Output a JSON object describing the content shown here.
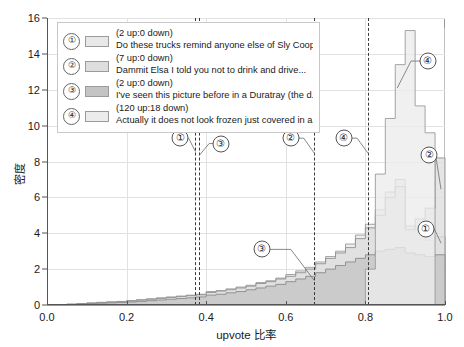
{
  "chart_data": {
    "type": "area",
    "title": "",
    "xlabel": "upvote 比率",
    "ylabel": "密度",
    "xlim": [
      0.0,
      1.0
    ],
    "ylim": [
      0,
      16
    ],
    "grid": true,
    "legend_position": "upper-left",
    "xticks": [
      "0.0",
      "0.2",
      "0.4",
      "0.6",
      "0.8",
      "1.0"
    ],
    "xtick_values": [
      0.0,
      0.2,
      0.4,
      0.6,
      0.8,
      1.0
    ],
    "yticks": [
      "0",
      "2",
      "4",
      "6",
      "8",
      "10",
      "12",
      "14",
      "16"
    ],
    "ytick_values": [
      0,
      2,
      4,
      6,
      8,
      10,
      12,
      14,
      16
    ],
    "bin_edges": [
      0.0,
      0.025,
      0.05,
      0.075,
      0.1,
      0.125,
      0.15,
      0.175,
      0.2,
      0.225,
      0.25,
      0.275,
      0.3,
      0.325,
      0.35,
      0.375,
      0.4,
      0.425,
      0.45,
      0.475,
      0.5,
      0.525,
      0.55,
      0.575,
      0.6,
      0.625,
      0.65,
      0.675,
      0.7,
      0.725,
      0.75,
      0.775,
      0.8,
      0.825,
      0.85,
      0.875,
      0.9,
      0.925,
      0.95,
      0.975,
      1.0
    ],
    "series": [
      {
        "name": "series-1",
        "label": "Do these trucks remind anyone else of Sly Cooper?...",
        "color": "#e8e8e8",
        "edge": "#9b9b9b",
        "values": [
          0,
          0,
          0.05,
          0.08,
          0.12,
          0.15,
          0.18,
          0.2,
          0.25,
          0.3,
          0.35,
          0.4,
          0.45,
          0.5,
          0.55,
          0.6,
          0.75,
          0.8,
          0.9,
          1.0,
          1.1,
          1.25,
          1.35,
          1.5,
          1.7,
          1.9,
          2.1,
          2.4,
          2.7,
          3.0,
          3.4,
          3.9,
          4.5,
          5.3,
          6.3,
          7.0,
          4.4,
          4.0,
          3.6,
          3.8
        ]
      },
      {
        "name": "series-2",
        "label": "Dammit Elsa I told you not to drink and drive...",
        "color": "#dedede",
        "edge": "#8f8f8f",
        "values": [
          0,
          0,
          0.04,
          0.07,
          0.1,
          0.13,
          0.16,
          0.18,
          0.22,
          0.27,
          0.32,
          0.37,
          0.42,
          0.47,
          0.52,
          0.57,
          0.7,
          0.78,
          0.85,
          0.95,
          1.05,
          1.2,
          1.3,
          1.45,
          1.6,
          1.8,
          2.0,
          2.3,
          2.6,
          2.9,
          3.2,
          3.7,
          4.3,
          5.0,
          6.0,
          6.6,
          4.2,
          4.8,
          5.4,
          8.2
        ]
      },
      {
        "name": "series-3",
        "label": "I've seen this picture before in a Duratray (the d....",
        "color": "#c4c4c4",
        "edge": "#8a8a8a",
        "values": [
          0,
          0,
          0.03,
          0.05,
          0.08,
          0.1,
          0.12,
          0.14,
          0.17,
          0.2,
          0.24,
          0.28,
          0.32,
          0.36,
          0.4,
          0.45,
          0.55,
          0.6,
          0.68,
          0.75,
          0.85,
          0.95,
          1.05,
          1.15,
          1.3,
          1.45,
          1.6,
          1.8,
          2.0,
          2.2,
          2.4,
          2.6,
          2.8,
          3.0,
          3.1,
          3.2,
          2.9,
          2.8,
          2.7,
          2.8
        ]
      },
      {
        "name": "series-4",
        "label": "Actually it does not look frozen just covered in a...",
        "color": "#ececec",
        "edge": "#9b9b9b",
        "values": [
          0,
          0,
          0,
          0,
          0,
          0,
          0,
          0,
          0,
          0,
          0,
          0,
          0,
          0,
          0,
          0,
          0,
          0,
          0,
          0,
          0,
          0,
          0,
          0,
          0,
          0,
          0,
          0,
          0,
          0,
          0,
          0,
          2.0,
          7.3,
          10.4,
          13.4,
          15.3,
          11.1,
          9.6,
          0
        ]
      }
    ],
    "vlines": [
      {
        "name": "vline-a",
        "x": 0.373
      },
      {
        "name": "vline-b",
        "x": 0.383
      },
      {
        "name": "vline-c",
        "x": 0.672
      },
      {
        "name": "vline-d",
        "x": 0.807
      }
    ],
    "annotations": [
      {
        "name": "annotation-1-left",
        "marker": "①",
        "x": 0.335,
        "y": 9.3,
        "tip_x": 0.373,
        "tip_y": 8.55
      },
      {
        "name": "annotation-3-left",
        "marker": "③",
        "x": 0.437,
        "y": 9.0,
        "tip_x": 0.383,
        "tip_y": 8.35
      },
      {
        "name": "annotation-2-mid",
        "marker": "②",
        "x": 0.612,
        "y": 9.3,
        "tip_x": 0.672,
        "tip_y": 8.45
      },
      {
        "name": "annotation-4-mid",
        "marker": "④",
        "x": 0.745,
        "y": 9.3,
        "tip_x": 0.807,
        "tip_y": 8.45
      },
      {
        "name": "annotation-3-low",
        "marker": "③",
        "x": 0.54,
        "y": 3.1,
        "tip_x": 0.672,
        "tip_y": 1.35
      },
      {
        "name": "annotation-4-peak",
        "marker": "④",
        "x": 0.957,
        "y": 13.6,
        "tip_x": 0.88,
        "tip_y": 12.1
      },
      {
        "name": "annotation-2-right",
        "marker": "②",
        "x": 0.96,
        "y": 8.35,
        "tip_x": 0.99,
        "tip_y": 6.45
      },
      {
        "name": "annotation-1-right",
        "marker": "①",
        "x": 0.952,
        "y": 4.25,
        "tip_x": 0.99,
        "tip_y": 3.45
      }
    ],
    "legend_entries": [
      {
        "marker": "①",
        "count": "(2 up:0 down)",
        "text": "Do these trucks remind anyone else of Sly Cooper?...",
        "swatch": "#e8e8e8"
      },
      {
        "marker": "②",
        "count": "(7 up:0 down)",
        "text": "Dammit Elsa I told you not to drink and drive...",
        "swatch": "#dedede"
      },
      {
        "marker": "③",
        "count": "(2 up:0 down)",
        "text": "I've seen this picture before in a Duratray (the d....",
        "swatch": "#c4c4c4"
      },
      {
        "marker": "④",
        "count": "(120 up:18 down)",
        "text": "Actually it does not look frozen just covered in a...",
        "swatch": "#ececec"
      }
    ]
  }
}
